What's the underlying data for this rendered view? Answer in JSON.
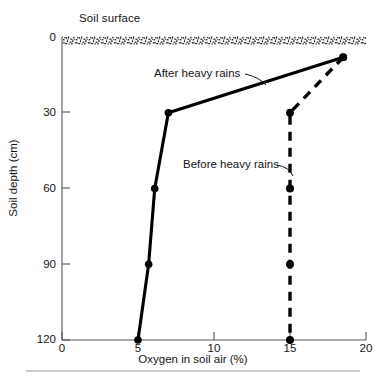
{
  "figure": {
    "soil_surface_label": "Soil surface",
    "bottom_rule": true
  },
  "chart_data": {
    "type": "line",
    "title": "",
    "xlabel": "Oxygen in soil air (%)",
    "ylabel": "Soil depth (cm)",
    "xlim": [
      0,
      20
    ],
    "ylim": [
      0,
      120
    ],
    "y_inverted": true,
    "grid": false,
    "legend_position": "inline-annotations",
    "xticks": [
      0,
      5,
      10,
      15,
      20
    ],
    "xtick_labels": [
      "0",
      "5",
      "10",
      "15",
      "20"
    ],
    "yticks": [
      0,
      30,
      60,
      90,
      120
    ],
    "ytick_labels": [
      "0",
      "30",
      "60",
      "90",
      "120"
    ],
    "series": [
      {
        "name": "After heavy rains",
        "style": "solid",
        "color": "#000000",
        "markers": true,
        "x": [
          18.5,
          7.0,
          6.1,
          5.7,
          5.0
        ],
        "y": [
          8,
          30,
          60,
          90,
          120
        ]
      },
      {
        "name": "Before heavy rains",
        "style": "dashed",
        "color": "#000000",
        "markers": true,
        "x": [
          18.5,
          15.0,
          15.0,
          15.0,
          15.0
        ],
        "y": [
          8,
          30,
          60,
          90,
          120
        ]
      }
    ],
    "annotations": [
      {
        "text": "After heavy rains",
        "x": 7.9,
        "y": 21
      },
      {
        "text": "Before heavy rains",
        "x": 9.8,
        "y": 57
      },
      {
        "text": "Soil surface",
        "x": 1.2,
        "y": -10
      }
    ]
  }
}
